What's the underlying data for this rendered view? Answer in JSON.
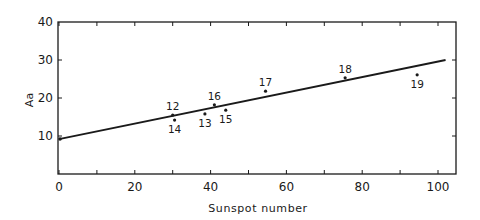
{
  "chart_data": {
    "type": "scatter",
    "title": "",
    "xlabel": "Sunspot number",
    "ylabel": "Aa",
    "xlim": [
      0,
      105
    ],
    "ylim": [
      0,
      40
    ],
    "xticks": [
      0,
      20,
      40,
      60,
      80,
      100
    ],
    "xtick_labels": [
      "0",
      "20",
      "40",
      "60",
      "80",
      "100"
    ],
    "xminor_ticks": [
      10,
      30,
      50,
      70,
      90
    ],
    "yticks": [
      10,
      20,
      30,
      40
    ],
    "ytick_labels": [
      "10",
      "20",
      "30",
      "40"
    ],
    "grid": false,
    "legend": null,
    "points": [
      {
        "label": "12",
        "x": 30,
        "y": 15.5,
        "label_pos": "above"
      },
      {
        "label": "14",
        "x": 30.5,
        "y": 14.2,
        "label_pos": "below"
      },
      {
        "label": "13",
        "x": 38.5,
        "y": 15.8,
        "label_pos": "below"
      },
      {
        "label": "16",
        "x": 41,
        "y": 18.2,
        "label_pos": "above"
      },
      {
        "label": "15",
        "x": 44,
        "y": 16.8,
        "label_pos": "below"
      },
      {
        "label": "17",
        "x": 54.5,
        "y": 21.8,
        "label_pos": "above"
      },
      {
        "label": "18",
        "x": 75.5,
        "y": 25.3,
        "label_pos": "above"
      },
      {
        "label": "19",
        "x": 94.5,
        "y": 26.1,
        "label_pos": "below"
      }
    ],
    "extra_points": [
      {
        "label": "",
        "x": 0,
        "y": 9.2
      }
    ],
    "fit_line": {
      "x": [
        0,
        102
      ],
      "y": [
        9.2,
        30.0
      ]
    }
  }
}
